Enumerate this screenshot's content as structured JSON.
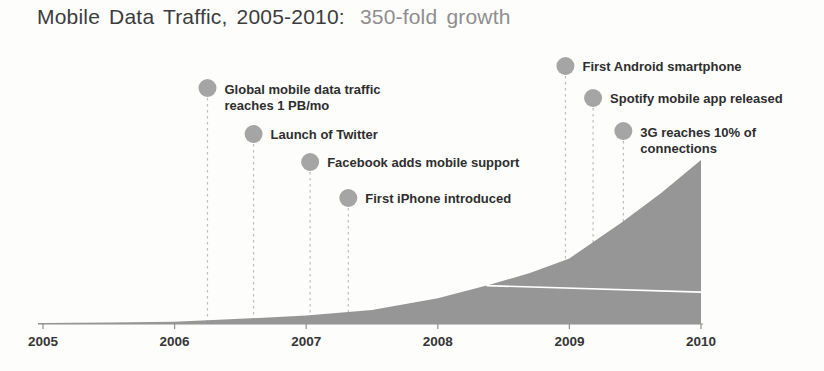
{
  "title": {
    "main": "Mobile Data Traffic, 2005-2010:",
    "highlight": "350-fold growth"
  },
  "colors": {
    "background": "#fdfdfc",
    "title_main": "#3c3c3c",
    "title_highlight": "#8e8e8e",
    "area_fill": "#969696",
    "axis_line": "#8f8f8f",
    "axis_label": "#353535",
    "annotation_text": "#2e2e2e",
    "milestone_dot": "#a5a5a5",
    "dashed_line": "#bdbdbd",
    "inner_line": "#ffffff"
  },
  "chart_data": {
    "type": "area",
    "title": "Mobile Data Traffic, 2005-2010: 350-fold growth",
    "xlabel": "",
    "ylabel": "",
    "x_ticks": [
      "2005",
      "2006",
      "2007",
      "2008",
      "2009",
      "2010"
    ],
    "xlim": [
      2005,
      2010
    ],
    "ylim": [
      0,
      350
    ],
    "grid": false,
    "legend": "none",
    "value_meaning": "Global mobile data traffic, relative scale (2005 = 1, 2010 = 350; 350-fold growth)",
    "series": [
      {
        "name": "Global mobile data traffic",
        "points": [
          [
            2005.0,
            2
          ],
          [
            2005.5,
            3
          ],
          [
            2006.0,
            5
          ],
          [
            2006.5,
            11
          ],
          [
            2007.0,
            18
          ],
          [
            2007.5,
            30
          ],
          [
            2008.0,
            55
          ],
          [
            2008.4,
            84
          ],
          [
            2008.7,
            109
          ],
          [
            2009.0,
            140
          ],
          [
            2009.4,
            217
          ],
          [
            2009.7,
            280
          ],
          [
            2010.0,
            350
          ]
        ]
      }
    ],
    "inner_divider_line": {
      "start": [
        2008.37,
        82
      ],
      "end": [
        2010,
        68
      ]
    },
    "milestones": [
      {
        "year": 2006.25,
        "lines": [
          "Global mobile data traffic",
          "reaches 1 PB/mo"
        ],
        "dot_y_px": 88
      },
      {
        "year": 2006.6,
        "lines": [
          "Launch of Twitter"
        ],
        "dot_y_px": 134
      },
      {
        "year": 2007.03,
        "lines": [
          "Facebook adds mobile support"
        ],
        "dot_y_px": 162
      },
      {
        "year": 2007.32,
        "lines": [
          "First iPhone introduced"
        ],
        "dot_y_px": 198
      },
      {
        "year": 2008.97,
        "lines": [
          "First Android smartphone"
        ],
        "dot_y_px": 66
      },
      {
        "year": 2009.18,
        "lines": [
          "Spotify mobile app released"
        ],
        "dot_y_px": 98
      },
      {
        "year": 2009.41,
        "lines": [
          "3G reaches 10% of",
          "connections"
        ],
        "dot_y_px": 131
      }
    ],
    "layout_px": {
      "width": 824,
      "height": 371,
      "plot_left_x": 43,
      "plot_right_x": 701,
      "baseline_y": 324,
      "peak_y": 160,
      "axis_start_x": 38,
      "axis_end_x": 703,
      "year_label_y": 346,
      "dot_radius": 9,
      "label_offset_x": 17
    }
  }
}
